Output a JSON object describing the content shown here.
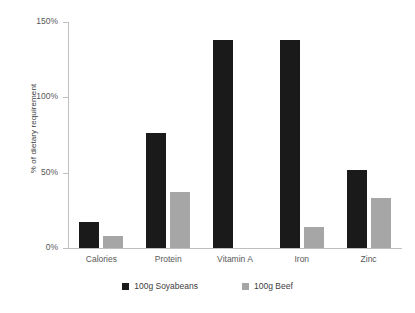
{
  "chart_data": {
    "type": "bar",
    "title": "",
    "subtitle": "",
    "xlabel": "",
    "ylabel": "% of dietary requirement",
    "categories": [
      "Calories",
      "Protein",
      "Vitamin A",
      "Iron",
      "Zinc"
    ],
    "series": [
      {
        "name": "100g Soyabeans",
        "color": "#1a1a1a",
        "values": [
          17,
          76,
          138,
          138,
          52
        ]
      },
      {
        "name": "100g Beef",
        "color": "#a6a6a6",
        "values": [
          8,
          37,
          0,
          14,
          33
        ]
      }
    ],
    "ylim": [
      0,
      150
    ],
    "ytick_labels": [
      "0%",
      "50%",
      "100%",
      "150%"
    ],
    "ytick_values": [
      0,
      50,
      100,
      150
    ],
    "grid": false,
    "legend_position": "bottom",
    "axis_color": "#bfbfbf",
    "text_color": "#404040"
  }
}
